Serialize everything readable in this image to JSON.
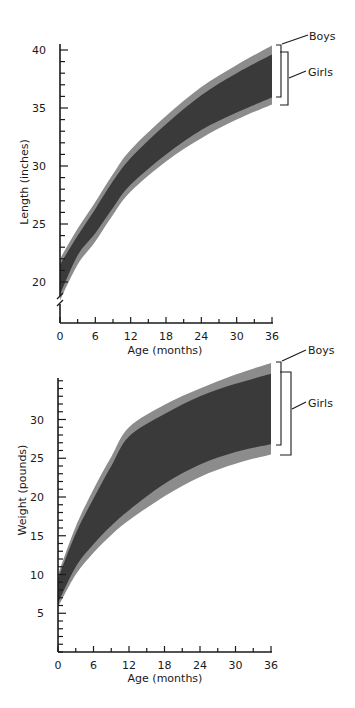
{
  "chart_data": [
    {
      "type": "area",
      "title": "",
      "xlabel": "Age (months)",
      "ylabel": "Length (inches)",
      "xlim": [
        0,
        36
      ],
      "ylim": [
        18,
        40.5
      ],
      "axis_break": true,
      "grid": false,
      "x_ticks": [
        0,
        6,
        12,
        18,
        24,
        30,
        36
      ],
      "x_minor_ticks": [
        3,
        9,
        15,
        21,
        27,
        33
      ],
      "y_ticks": [
        20,
        25,
        30,
        35,
        40
      ],
      "y_minor_step": 1,
      "legend": {
        "position": "right-end brackets",
        "entries": [
          "Boys",
          "Girls"
        ]
      },
      "x": [
        0,
        3,
        6,
        9,
        12,
        18,
        24,
        30,
        36
      ],
      "series": [
        {
          "name": "Boys",
          "color": "#8c8c8c",
          "lower": [
            18.9,
            22.3,
            24.2,
            26.4,
            28.4,
            31.0,
            33.1,
            34.6,
            35.9
          ],
          "upper": [
            22.0,
            24.6,
            26.9,
            29.3,
            31.4,
            34.3,
            36.8,
            38.7,
            40.4
          ]
        },
        {
          "name": "Girls",
          "color": "#8c8c8c",
          "lower": [
            18.4,
            21.5,
            23.5,
            25.8,
            27.8,
            30.4,
            32.4,
            34.0,
            35.3
          ],
          "upper": [
            21.5,
            24.0,
            26.3,
            28.7,
            30.7,
            33.6,
            36.1,
            38.0,
            39.6
          ]
        },
        {
          "name": "Overlap",
          "color": "#3a3a3a",
          "lower": [
            18.9,
            22.3,
            24.2,
            26.4,
            28.4,
            31.0,
            33.1,
            34.6,
            35.9
          ],
          "upper": [
            21.5,
            24.0,
            26.3,
            28.7,
            30.7,
            33.6,
            36.1,
            38.0,
            39.6
          ]
        }
      ]
    },
    {
      "type": "area",
      "title": "",
      "xlabel": "Age (months)",
      "ylabel": "Weight (pounds)",
      "xlim": [
        0,
        36
      ],
      "ylim": [
        0,
        35.5
      ],
      "axis_break": false,
      "grid": false,
      "x_ticks": [
        0,
        6,
        12,
        18,
        24,
        30,
        36
      ],
      "x_minor_ticks": [
        3,
        9,
        15,
        21,
        27,
        33
      ],
      "y_ticks": [
        5,
        10,
        15,
        20,
        25,
        30
      ],
      "y_minor_step": 1,
      "legend": {
        "position": "right-end brackets",
        "entries": [
          "Boys",
          "Girls"
        ]
      },
      "x": [
        0,
        3,
        6,
        9,
        12,
        18,
        24,
        30,
        36
      ],
      "series": [
        {
          "name": "Boys",
          "color": "#8c8c8c",
          "lower": [
            6.3,
            11.0,
            13.9,
            16.3,
            18.3,
            21.7,
            24.2,
            25.8,
            26.8
          ],
          "upper": [
            10.0,
            16.2,
            21.0,
            25.2,
            29.0,
            31.9,
            34.0,
            35.8,
            37.3
          ]
        },
        {
          "name": "Girls",
          "color": "#8c8c8c",
          "lower": [
            5.8,
            10.0,
            12.8,
            15.1,
            17.0,
            20.1,
            22.6,
            24.3,
            25.5
          ],
          "upper": [
            9.5,
            15.3,
            19.8,
            24.0,
            27.8,
            30.7,
            33.0,
            34.6,
            35.9
          ]
        },
        {
          "name": "Overlap",
          "color": "#3a3a3a",
          "lower": [
            6.3,
            11.0,
            13.9,
            16.3,
            18.3,
            21.7,
            24.2,
            25.8,
            26.8
          ],
          "upper": [
            9.5,
            15.3,
            19.8,
            24.0,
            27.8,
            30.7,
            33.0,
            34.6,
            35.9
          ]
        }
      ]
    }
  ],
  "charts": {
    "length": {
      "ylabel": "Length (inches)",
      "xlabel": "Age (months)",
      "x_tick_labels": [
        "0",
        "6",
        "12",
        "18",
        "24",
        "30",
        "36"
      ],
      "y_tick_labels": [
        "20",
        "25",
        "30",
        "35",
        "40"
      ],
      "legend_boys": "Boys",
      "legend_girls": "Girls"
    },
    "weight": {
      "ylabel": "Weight (pounds)",
      "xlabel": "Age (months)",
      "x_tick_labels": [
        "0",
        "6",
        "12",
        "18",
        "24",
        "30",
        "36"
      ],
      "y_tick_labels": [
        "5",
        "10",
        "15",
        "20",
        "25",
        "30"
      ],
      "legend_boys": "Boys",
      "legend_girls": "Girls"
    }
  },
  "colors": {
    "outer_band": "#8c8c8c",
    "overlap_band": "#3a3a3a",
    "axis": "#1a1a1a"
  }
}
